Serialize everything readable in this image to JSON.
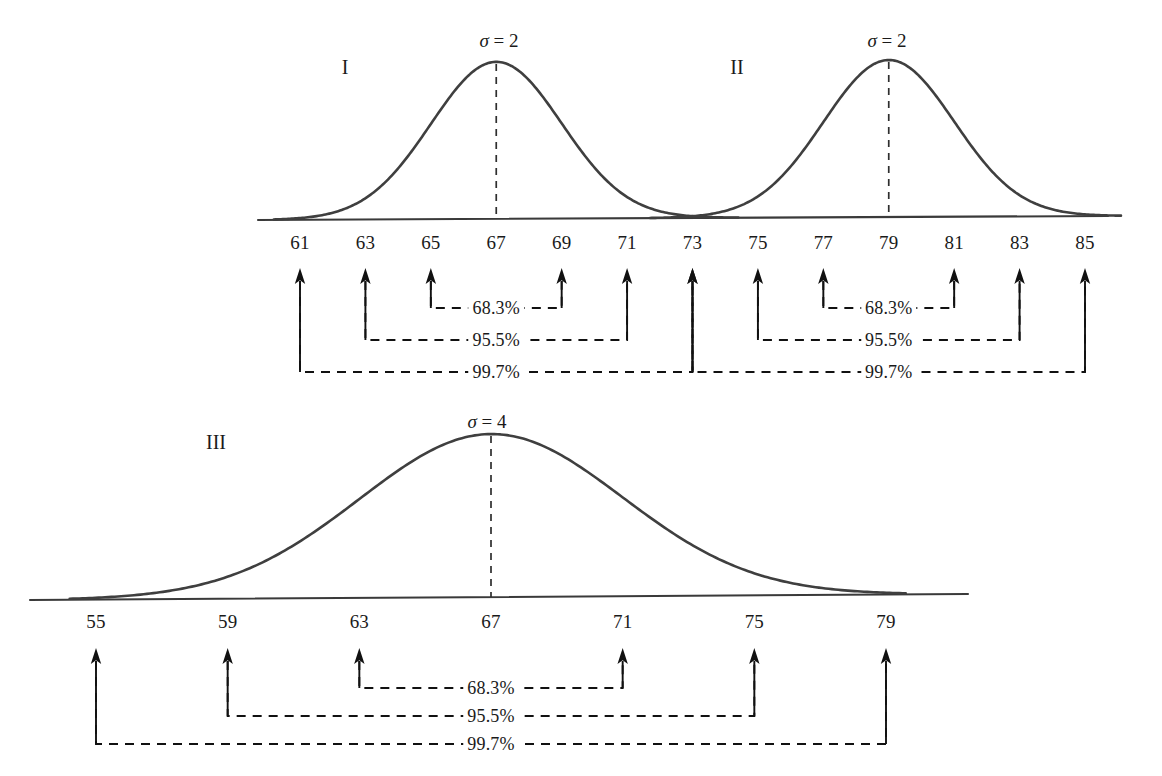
{
  "figure": {
    "kind": "normal-distribution-empirical-rule",
    "percent_labels": {
      "one_sd": "68.3%",
      "two_sd": "95.5%",
      "three_sd": "99.7%"
    }
  },
  "panels": [
    {
      "id": "panel-I",
      "roman": "I",
      "sigma_label": "σ = 2",
      "sigma": 2,
      "mean": 67,
      "ticks": [
        "61",
        "63",
        "65",
        "67",
        "69",
        "71",
        "73"
      ],
      "arrow_ticks": [
        "61",
        "63",
        "65",
        "69",
        "71",
        "73"
      ],
      "brackets": [
        {
          "label": "68.3%",
          "from": "65",
          "to": "69"
        },
        {
          "label": "95.5%",
          "from": "63",
          "to": "71"
        },
        {
          "label": "99.7%",
          "from": "61",
          "to": "73"
        }
      ]
    },
    {
      "id": "panel-II",
      "roman": "II",
      "sigma_label": "σ = 2",
      "sigma": 2,
      "mean": 79,
      "ticks": [
        "73",
        "75",
        "77",
        "79",
        "81",
        "83",
        "85"
      ],
      "arrow_ticks": [
        "73",
        "75",
        "77",
        "81",
        "83",
        "85"
      ],
      "brackets": [
        {
          "label": "68.3%",
          "from": "77",
          "to": "81"
        },
        {
          "label": "95.5%",
          "from": "75",
          "to": "83"
        },
        {
          "label": "99.7%",
          "from": "73",
          "to": "85"
        }
      ]
    },
    {
      "id": "panel-III",
      "roman": "III",
      "sigma_label": "σ = 4",
      "sigma": 4,
      "mean": 67,
      "ticks": [
        "55",
        "59",
        "63",
        "67",
        "71",
        "75",
        "79"
      ],
      "arrow_ticks": [
        "55",
        "59",
        "63",
        "71",
        "75",
        "79"
      ],
      "brackets": [
        {
          "label": "68.3%",
          "from": "63",
          "to": "71"
        },
        {
          "label": "95.5%",
          "from": "59",
          "to": "75"
        },
        {
          "label": "99.7%",
          "from": "55",
          "to": "79"
        }
      ]
    }
  ],
  "chart_data": {
    "type": "line",
    "title": "",
    "xlabel": "",
    "ylabel": "",
    "grid": false,
    "legend": "none",
    "annotation_note": "Three normal density curves annotated with the 68-95-99.7 empirical rule. Arrows mark every tick except the mean of each curve.",
    "series": [
      {
        "name": "I",
        "distribution": "normal",
        "mean": 67,
        "sd": 2,
        "sigma_label": "σ = 2",
        "x_ticks": [
          61,
          63,
          65,
          67,
          69,
          71,
          73
        ],
        "intervals": [
          {
            "label": "68.3%",
            "lower": 65,
            "upper": 69,
            "sd_multiple": 1
          },
          {
            "label": "95.5%",
            "lower": 63,
            "upper": 71,
            "sd_multiple": 2
          },
          {
            "label": "99.7%",
            "lower": 61,
            "upper": 73,
            "sd_multiple": 3
          }
        ]
      },
      {
        "name": "II",
        "distribution": "normal",
        "mean": 79,
        "sd": 2,
        "sigma_label": "σ = 2",
        "x_ticks": [
          73,
          75,
          77,
          79,
          81,
          83,
          85
        ],
        "intervals": [
          {
            "label": "68.3%",
            "lower": 77,
            "upper": 81,
            "sd_multiple": 1
          },
          {
            "label": "95.5%",
            "lower": 75,
            "upper": 83,
            "sd_multiple": 2
          },
          {
            "label": "99.7%",
            "lower": 73,
            "upper": 85,
            "sd_multiple": 3
          }
        ]
      },
      {
        "name": "III",
        "distribution": "normal",
        "mean": 67,
        "sd": 4,
        "sigma_label": "σ = 4",
        "x_ticks": [
          55,
          59,
          63,
          67,
          71,
          75,
          79
        ],
        "intervals": [
          {
            "label": "68.3%",
            "lower": 63,
            "upper": 71,
            "sd_multiple": 1
          },
          {
            "label": "95.5%",
            "lower": 59,
            "upper": 75,
            "sd_multiple": 2
          },
          {
            "label": "99.7%",
            "lower": 55,
            "upper": 79,
            "sd_multiple": 3
          }
        ]
      }
    ],
    "axes": [
      {
        "name": "top-axis",
        "ticks": [
          61,
          63,
          65,
          67,
          69,
          71,
          73,
          75,
          77,
          79,
          81,
          83,
          85
        ],
        "range": [
          61,
          85
        ]
      },
      {
        "name": "bottom-axis",
        "ticks": [
          55,
          59,
          63,
          67,
          71,
          75,
          79
        ],
        "range": [
          55,
          79
        ]
      }
    ]
  }
}
